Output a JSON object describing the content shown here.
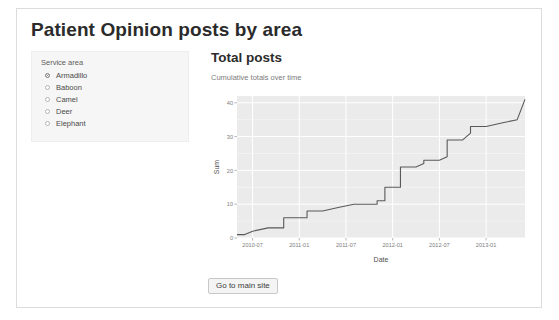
{
  "page": {
    "title": "Patient Opinion posts by area"
  },
  "sidebar": {
    "group_label": "Service area",
    "options": [
      {
        "label": "Armadillo",
        "selected": true
      },
      {
        "label": "Baboon",
        "selected": false
      },
      {
        "label": "Camel",
        "selected": false
      },
      {
        "label": "Deer",
        "selected": false
      },
      {
        "label": "Elephant",
        "selected": false
      }
    ]
  },
  "main": {
    "heading": "Total posts",
    "subheading": "Cumulative totals over time"
  },
  "footer": {
    "main_site_label": "Go to main site"
  },
  "colors": {
    "panel_background": "#ebebeb",
    "grid_major": "#ffffff",
    "grid_minor": "#f5f5f5",
    "line": "#595959",
    "card_border": "#dcdcdc",
    "sidebar_background": "#f6f6f6"
  },
  "chart_data": {
    "type": "line",
    "title": "",
    "xlabel": "Date",
    "ylabel": "Sum",
    "grid": true,
    "legend": null,
    "x_tick_labels": [
      "2010-07",
      "2011-01",
      "2011-07",
      "2012-01",
      "2012-07",
      "2013-01"
    ],
    "y_tick_labels": [
      "0",
      "10",
      "20",
      "30",
      "40"
    ],
    "ylim": [
      0,
      42
    ],
    "xlim": [
      "2010-05",
      "2013-06"
    ],
    "series": [
      {
        "name": "Cumulative posts",
        "x": [
          "2010-05",
          "2010-06",
          "2010-07",
          "2010-09",
          "2010-11",
          "2010-11",
          "2011-01",
          "2011-02",
          "2011-02",
          "2011-04",
          "2011-06",
          "2011-06",
          "2011-08",
          "2011-10",
          "2011-11",
          "2011-11",
          "2011-12",
          "2011-12",
          "2012-01",
          "2012-02",
          "2012-02",
          "2012-04",
          "2012-05",
          "2012-05",
          "2012-07",
          "2012-08",
          "2012-08",
          "2012-10",
          "2012-11",
          "2012-11",
          "2013-01",
          "2013-03",
          "2013-05",
          "2013-05",
          "2013-06"
        ],
        "y": [
          1,
          1,
          2,
          3,
          3,
          6,
          6,
          6,
          8,
          8,
          9,
          9,
          10,
          10,
          10,
          11,
          11,
          15,
          15,
          15,
          21,
          21,
          22,
          23,
          23,
          24,
          29,
          29,
          31,
          33,
          33,
          34,
          35,
          35,
          41
        ]
      }
    ]
  }
}
